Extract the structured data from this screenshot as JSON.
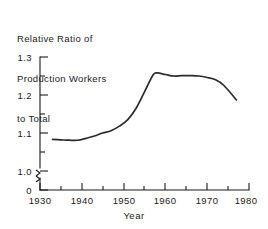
{
  "chart_data": {
    "type": "line",
    "title": "Relative Ratio of Production Workers to Total",
    "title_lines": [
      "Relative Ratio of",
      "Production Workers",
      "to Total"
    ],
    "xlabel": "Year",
    "ylabel": "",
    "xlim": [
      1930,
      1980
    ],
    "ylim": [
      1.0,
      1.3
    ],
    "y_axis_break": true,
    "y_axis_break_note": "axis broken between 0 and 1.0",
    "grid": false,
    "legend": null,
    "xticks": [
      1930,
      1940,
      1950,
      1960,
      1970,
      1980
    ],
    "xtick_labels": [
      "1930",
      "1940",
      "1950",
      "1960",
      "1970",
      "1980"
    ],
    "xminor_ticks": [
      1935,
      1945,
      1955,
      1965,
      1975
    ],
    "yticks": [
      0,
      1.0,
      1.1,
      1.2,
      1.3
    ],
    "ytick_labels": [
      "0",
      "1.0",
      "1.1",
      "1.2",
      "1.3"
    ],
    "yminor_ticks": [
      1.05,
      1.15,
      1.25
    ],
    "series": [
      {
        "name": "Relative Ratio of Production Workers to Total",
        "color": "#2b2b2b",
        "x": [
          1933,
          1935,
          1937,
          1939,
          1941,
          1943,
          1945,
          1947,
          1949,
          1951,
          1953,
          1955,
          1957,
          1958,
          1960,
          1962,
          1964,
          1966,
          1968,
          1970,
          1972,
          1974,
          1977
        ],
        "y": [
          1.083,
          1.082,
          1.081,
          1.081,
          1.086,
          1.092,
          1.1,
          1.106,
          1.118,
          1.135,
          1.165,
          1.208,
          1.252,
          1.258,
          1.254,
          1.25,
          1.251,
          1.251,
          1.25,
          1.246,
          1.24,
          1.225,
          1.187
        ]
      }
    ]
  },
  "axis_geometry": {
    "plot_left_px": 40,
    "plot_right_px": 249,
    "y_top_px": 57,
    "y_1_0_px": 171,
    "baseline_px": 190
  }
}
